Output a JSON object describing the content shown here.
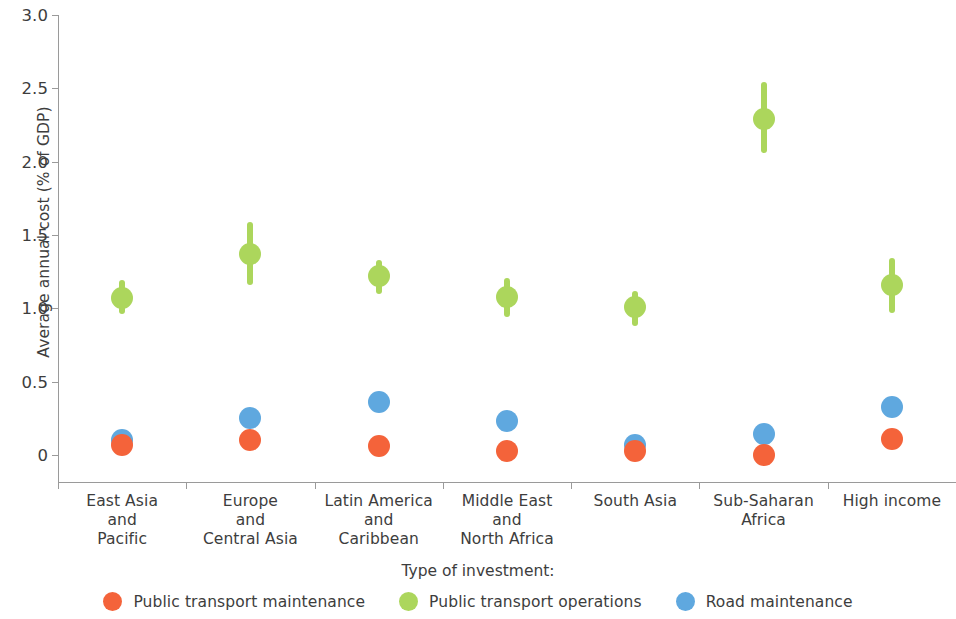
{
  "chart_data": {
    "type": "scatter",
    "title": "",
    "xlabel": "",
    "ylabel": "Average annual cost (% of GDP)",
    "ylim": [
      0,
      3.0
    ],
    "yticks": [
      0,
      0.5,
      1.0,
      1.5,
      2.0,
      2.5,
      3.0
    ],
    "ytick_labels": [
      "0",
      "0.5",
      "1.0",
      "1.5",
      "2.0",
      "2.5",
      "3.0"
    ],
    "grid": false,
    "legend_position": "bottom",
    "legend_title": "Type of investment:",
    "categories": [
      "East Asia\nand\nPacific",
      "Europe\nand\nCentral Asia",
      "Latin America\nand\nCaribbean",
      "Middle East\nand\nNorth Africa",
      "South Asia",
      "Sub-Saharan\nAfrica",
      "High income"
    ],
    "series": [
      {
        "name": "Public transport maintenance",
        "color": "#f4633a",
        "values": [
          0.07,
          0.1,
          0.06,
          0.03,
          0.03,
          0.0,
          0.11
        ],
        "errors_low": [
          0.07,
          0.1,
          0.06,
          0.03,
          0.03,
          0.0,
          0.11
        ],
        "errors_high": [
          0.07,
          0.1,
          0.06,
          0.03,
          0.03,
          0.0,
          0.11
        ]
      },
      {
        "name": "Public transport operations",
        "color": "#acd65c",
        "values": [
          1.07,
          1.37,
          1.22,
          1.08,
          1.01,
          2.29,
          1.16
        ],
        "errors_low": [
          0.96,
          1.16,
          1.1,
          0.94,
          0.88,
          2.06,
          0.97
        ],
        "errors_high": [
          1.19,
          1.59,
          1.33,
          1.21,
          1.12,
          2.54,
          1.34
        ]
      },
      {
        "name": "Road maintenance",
        "color": "#5fa8df",
        "values": [
          0.1,
          0.25,
          0.36,
          0.23,
          0.07,
          0.14,
          0.33
        ],
        "errors_low": [
          0.1,
          0.25,
          0.36,
          0.23,
          0.07,
          0.14,
          0.33
        ],
        "errors_high": [
          0.1,
          0.25,
          0.36,
          0.23,
          0.07,
          0.14,
          0.33
        ]
      }
    ]
  },
  "legend": {
    "title": "Type of investment:",
    "items": [
      {
        "label": "Public transport maintenance",
        "color": "#f4633a"
      },
      {
        "label": "Public transport operations",
        "color": "#acd65c"
      },
      {
        "label": "Road maintenance",
        "color": "#5fa8df"
      }
    ]
  }
}
